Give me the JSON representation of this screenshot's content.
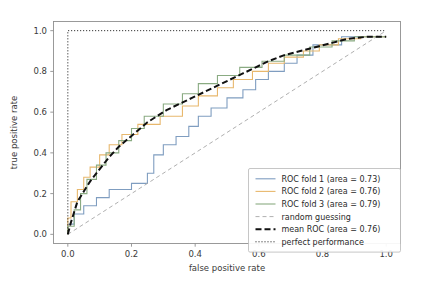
{
  "chart_data": {
    "type": "line",
    "title": "",
    "xlabel": "false positive rate",
    "ylabel": "true positive rate",
    "xlim": [
      -0.045,
      1.045
    ],
    "ylim": [
      -0.045,
      1.045
    ],
    "xticks": [
      0.0,
      0.2,
      0.4,
      0.6,
      0.8,
      1.0
    ],
    "yticks": [
      0.0,
      0.2,
      0.4,
      0.6,
      0.8,
      1.0
    ],
    "xticklabels": [
      "0.0",
      "0.2",
      "0.4",
      "0.6",
      "0.8",
      "1.0"
    ],
    "yticklabels": [
      "0.0",
      "0.2",
      "0.4",
      "0.6",
      "0.8",
      "1.0"
    ],
    "grid": false,
    "legend_position": "lower right",
    "series": [
      {
        "name": "ROC fold 1 (area = 0.73)",
        "color": "#7f9dc0",
        "dash": "none",
        "width": 1.1,
        "step": true,
        "x": [
          0.0,
          0.0,
          0.02,
          0.02,
          0.05,
          0.05,
          0.09,
          0.09,
          0.13,
          0.13,
          0.16,
          0.16,
          0.2,
          0.2,
          0.25,
          0.25,
          0.27,
          0.27,
          0.3,
          0.3,
          0.34,
          0.34,
          0.38,
          0.38,
          0.41,
          0.41,
          0.45,
          0.45,
          0.5,
          0.5,
          0.55,
          0.55,
          0.59,
          0.59,
          0.63,
          0.63,
          0.68,
          0.68,
          0.72,
          0.72,
          0.77,
          0.77,
          0.86,
          0.86,
          1.0
        ],
        "y": [
          0.0,
          0.05,
          0.05,
          0.1,
          0.1,
          0.14,
          0.14,
          0.18,
          0.18,
          0.22,
          0.22,
          0.22,
          0.22,
          0.25,
          0.25,
          0.3,
          0.3,
          0.39,
          0.39,
          0.44,
          0.44,
          0.48,
          0.48,
          0.53,
          0.53,
          0.58,
          0.58,
          0.62,
          0.62,
          0.67,
          0.67,
          0.71,
          0.71,
          0.76,
          0.76,
          0.8,
          0.8,
          0.84,
          0.84,
          0.88,
          0.88,
          0.93,
          0.93,
          0.97,
          0.97
        ]
      },
      {
        "name": "ROC fold 2 (area = 0.76)",
        "color": "#e8b86d",
        "dash": "none",
        "width": 1.1,
        "step": true,
        "x": [
          0.0,
          0.0,
          0.01,
          0.01,
          0.03,
          0.03,
          0.05,
          0.05,
          0.07,
          0.07,
          0.1,
          0.1,
          0.13,
          0.13,
          0.17,
          0.17,
          0.22,
          0.22,
          0.29,
          0.29,
          0.36,
          0.36,
          0.41,
          0.41,
          0.47,
          0.47,
          0.52,
          0.52,
          0.58,
          0.58,
          0.63,
          0.63,
          0.68,
          0.68,
          0.74,
          0.74,
          0.79,
          0.79,
          0.85,
          0.85,
          0.92,
          0.92,
          1.0
        ],
        "y": [
          0.0,
          0.08,
          0.08,
          0.16,
          0.16,
          0.22,
          0.22,
          0.28,
          0.28,
          0.33,
          0.33,
          0.39,
          0.39,
          0.44,
          0.44,
          0.49,
          0.49,
          0.54,
          0.54,
          0.58,
          0.58,
          0.63,
          0.63,
          0.68,
          0.68,
          0.72,
          0.72,
          0.76,
          0.76,
          0.8,
          0.8,
          0.84,
          0.84,
          0.87,
          0.87,
          0.9,
          0.9,
          0.93,
          0.93,
          0.96,
          0.96,
          0.97,
          0.97
        ]
      },
      {
        "name": "ROC fold 3 (area = 0.79)",
        "color": "#8aab82",
        "dash": "none",
        "width": 1.1,
        "step": true,
        "x": [
          0.0,
          0.0,
          0.02,
          0.02,
          0.04,
          0.04,
          0.06,
          0.06,
          0.09,
          0.09,
          0.12,
          0.12,
          0.16,
          0.16,
          0.2,
          0.2,
          0.24,
          0.24,
          0.3,
          0.3,
          0.36,
          0.36,
          0.41,
          0.41,
          0.47,
          0.47,
          0.54,
          0.54,
          0.61,
          0.61,
          0.68,
          0.68,
          0.76,
          0.76,
          0.83,
          0.83,
          0.9,
          0.9,
          1.0
        ],
        "y": [
          0.0,
          0.04,
          0.04,
          0.12,
          0.12,
          0.2,
          0.2,
          0.27,
          0.27,
          0.34,
          0.34,
          0.4,
          0.4,
          0.46,
          0.46,
          0.52,
          0.52,
          0.58,
          0.58,
          0.64,
          0.64,
          0.69,
          0.69,
          0.74,
          0.74,
          0.78,
          0.78,
          0.82,
          0.82,
          0.85,
          0.85,
          0.88,
          0.88,
          0.92,
          0.92,
          0.95,
          0.95,
          0.97,
          0.97
        ]
      },
      {
        "name": "random guessing",
        "color": "#b0b0b0",
        "dash": "4,3",
        "width": 1.0,
        "step": false,
        "x": [
          0.0,
          1.0
        ],
        "y": [
          0.0,
          1.0
        ]
      },
      {
        "name": "mean ROC (area = 0.76)",
        "color": "#111111",
        "dash": "6,3",
        "width": 2.0,
        "step": false,
        "x": [
          0.0,
          0.01,
          0.02,
          0.03,
          0.05,
          0.07,
          0.09,
          0.11,
          0.13,
          0.16,
          0.19,
          0.22,
          0.25,
          0.28,
          0.31,
          0.35,
          0.39,
          0.43,
          0.47,
          0.51,
          0.55,
          0.59,
          0.63,
          0.68,
          0.73,
          0.78,
          0.83,
          0.88,
          0.94,
          1.0
        ],
        "y": [
          0.0,
          0.06,
          0.11,
          0.16,
          0.21,
          0.26,
          0.3,
          0.34,
          0.38,
          0.43,
          0.47,
          0.51,
          0.55,
          0.58,
          0.61,
          0.64,
          0.67,
          0.7,
          0.73,
          0.76,
          0.79,
          0.82,
          0.85,
          0.88,
          0.9,
          0.92,
          0.94,
          0.96,
          0.97,
          0.97
        ]
      },
      {
        "name": "perfect performance",
        "color": "#111111",
        "dash": "1,2",
        "width": 1.0,
        "step": false,
        "x": [
          0.0,
          0.0,
          1.0
        ],
        "y": [
          0.0,
          1.0,
          1.0
        ]
      }
    ]
  },
  "legend": {
    "items": [
      {
        "label": "ROC fold 1 (area = 0.73)"
      },
      {
        "label": "ROC fold 2 (area = 0.76)"
      },
      {
        "label": "ROC fold 3 (area = 0.79)"
      },
      {
        "label": "random guessing"
      },
      {
        "label": "mean ROC (area = 0.76)"
      },
      {
        "label": "perfect performance"
      }
    ]
  }
}
